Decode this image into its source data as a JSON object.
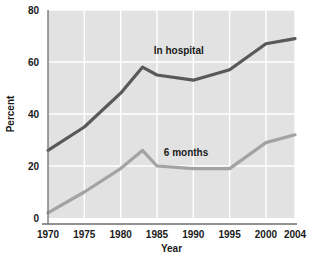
{
  "chart_data": {
    "type": "line",
    "title": "",
    "xlabel": "Year",
    "ylabel": "Percent",
    "xlim": [
      1970,
      2004
    ],
    "ylim": [
      0,
      80
    ],
    "grid": true,
    "legend_position": "inline-annotations",
    "plot_background": "#e2e2e2",
    "gridline_color": "#ffffff",
    "x_ticks": [
      "1970",
      "1975",
      "1980",
      "1985",
      "1990",
      "1995",
      "2000",
      "2004"
    ],
    "x_tick_values": [
      1970,
      1975,
      1980,
      1985,
      1990,
      1995,
      2000,
      2004
    ],
    "y_ticks": [
      "0",
      "20",
      "40",
      "60",
      "80"
    ],
    "y_tick_values": [
      0,
      20,
      40,
      60,
      80
    ],
    "x": [
      1970,
      1975,
      1980,
      1983,
      1985,
      1990,
      1995,
      2000,
      2004
    ],
    "series": [
      {
        "name": "In hospital",
        "color": "#595959",
        "values": [
          26,
          35,
          48,
          58,
          55,
          53,
          57,
          67,
          69
        ],
        "label_x": 1988,
        "label_y": 63
      },
      {
        "name": "6 months",
        "color": "#a3a3a3",
        "values": [
          2,
          10,
          19,
          26,
          20,
          19,
          19,
          29,
          32
        ],
        "label_x": 1989,
        "label_y": 24
      }
    ],
    "annotations": [
      {
        "text": "In hospital",
        "x": 1988,
        "y": 63
      },
      {
        "text": "6 months",
        "x": 1989,
        "y": 24
      }
    ]
  }
}
